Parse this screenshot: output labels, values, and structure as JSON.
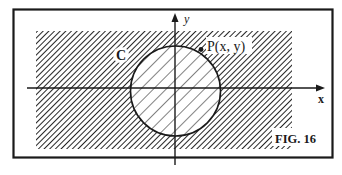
{
  "figure": {
    "caption": "FIG. 16",
    "curve_label": "C",
    "point_label": "P(x, y)",
    "x_axis_label": "x",
    "y_axis_label": "y"
  },
  "colors": {
    "ink": "#1a1a1a",
    "background": "#ffffff"
  },
  "regions": {
    "inside_circle": "wide diagonal hatching",
    "outside_circle": "dense diagonal hatching"
  }
}
